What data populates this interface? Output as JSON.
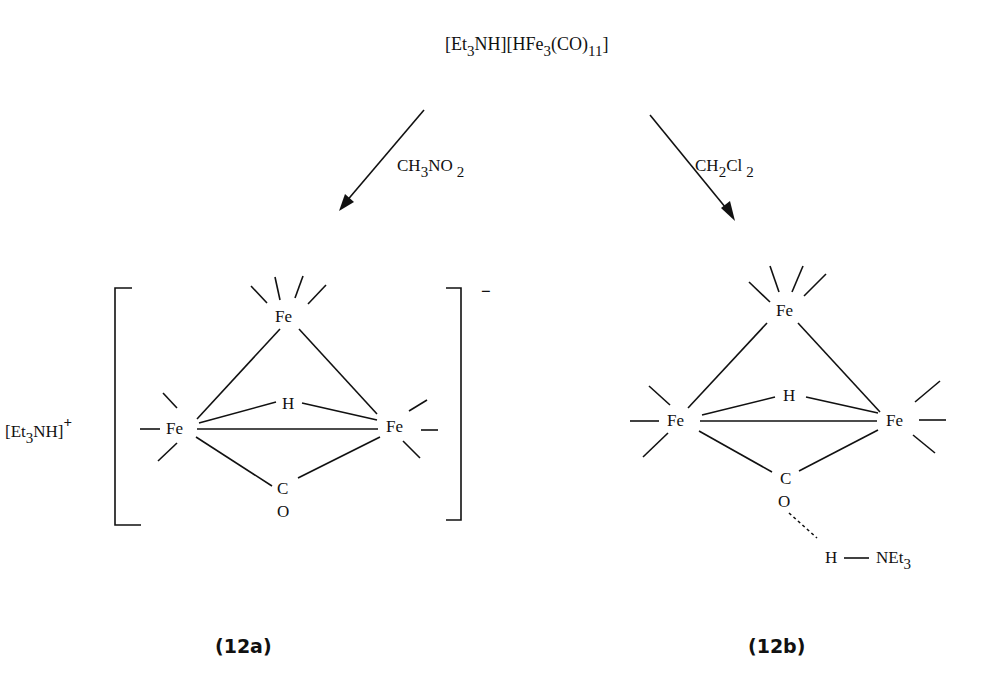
{
  "reactant": {
    "part1": "[Et",
    "sub1": "3",
    "part2": "NH][HFe",
    "sub2": "3",
    "part3": "(CO)",
    "sub3": "11",
    "part4": "]"
  },
  "arrows": {
    "left": {
      "solvent": "CH",
      "sub1": "3",
      "rest": "NO",
      "sub2": "2"
    },
    "right": {
      "solvent": "CH",
      "sub1": "2",
      "rest": "Cl",
      "sub2": "2"
    }
  },
  "product_a": {
    "cation": "[Et",
    "cation_sub": "3",
    "cation_rest": "NH]",
    "cation_charge": "+",
    "anion_charge": "−",
    "atoms": {
      "fe_top": "Fe",
      "fe_left": "Fe",
      "fe_right": "Fe",
      "h": "H",
      "c": "C",
      "o": "O"
    },
    "label": "(12a)"
  },
  "product_b": {
    "atoms": {
      "fe_top": "Fe",
      "fe_left": "Fe",
      "fe_right": "Fe",
      "h": "H",
      "c": "C",
      "o": "O",
      "h_bond": "H",
      "amine": "NEt",
      "amine_sub": "3"
    },
    "label": "(12b)"
  }
}
